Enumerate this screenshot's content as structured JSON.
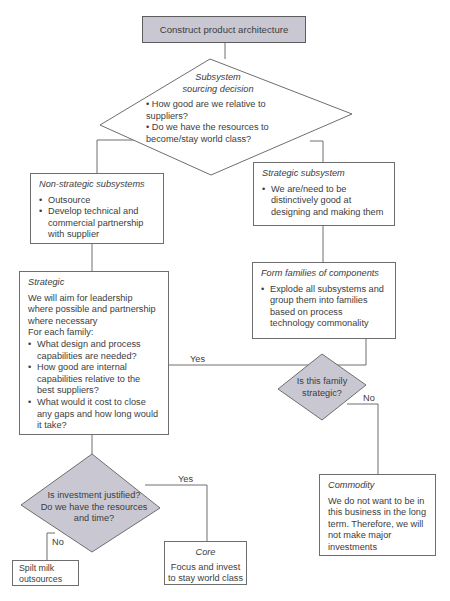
{
  "colors": {
    "decision_fill": "#c9c8d2",
    "start_fill": "#c9c8d2",
    "line": "#6e6e6e",
    "text": "#3c3c3c"
  },
  "nodes": {
    "start": {
      "label": "Construct product architecture"
    },
    "sourcing_decision": {
      "title_line1": "Subsystem",
      "title_line2": "sourcing decision",
      "bullets": [
        "How good are we relative to suppliers?",
        "Do we have the resources to become/stay world class?"
      ]
    },
    "non_strategic": {
      "title": "Non-strategic subsystems",
      "bullets": [
        "Outsource",
        "Develop technical and commercial partnership with supplier"
      ]
    },
    "strategic_subsystem": {
      "title": "Strategic subsystem",
      "bullets": [
        "We are/need to be distinctively good at designing and making them"
      ]
    },
    "form_families": {
      "title": "Form families of components",
      "bullets": [
        "Explode all subsystems and group them into families based on process technology commonality"
      ]
    },
    "family_decision": {
      "line1": "Is this family",
      "line2": "strategic?"
    },
    "strategic": {
      "title": "Strategic",
      "intro": "We will aim for leadership where possible and partnership where necessary",
      "for_each": "For each family:",
      "bullets": [
        "What design and process capabilities are needed?",
        "How good are internal capabilities relative to the best suppliers?",
        "What would it cost to close any gaps and how long would it take?"
      ]
    },
    "commodity": {
      "title": "Commodity",
      "text": "We do not want to be in this business in the long term. Therefore, we will not make major investments"
    },
    "investment_decision": {
      "line1": "Is investment justified?",
      "line2": "Do we have the resources",
      "line3": "and time?"
    },
    "core": {
      "title": "Core",
      "text": "Focus and invest to stay world class"
    },
    "spilt_milk": {
      "text": "Spilt milk outsources"
    }
  },
  "edge_labels": {
    "family_yes": "Yes",
    "family_no": "No",
    "investment_yes": "Yes",
    "investment_no": "No"
  }
}
